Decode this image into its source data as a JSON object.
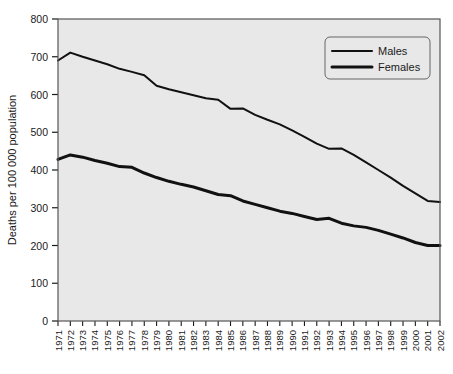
{
  "chart_data": {
    "type": "line",
    "title": "",
    "xlabel": "",
    "ylabel": "Deaths per 100 000 population",
    "ylim": [
      0,
      800
    ],
    "ytick_step": 100,
    "yticks": [
      "0",
      "100",
      "200",
      "300",
      "400",
      "500",
      "600",
      "700",
      "800"
    ],
    "grid": false,
    "legend_position": "top-right",
    "categories": [
      "1971",
      "1972",
      "1973",
      "1974",
      "1975",
      "1976",
      "1977",
      "1978",
      "1979",
      "1980",
      "1981",
      "1982",
      "1983",
      "1984",
      "1985",
      "1986",
      "1987",
      "1988",
      "1989",
      "1990",
      "1991",
      "1992",
      "1993",
      "1994",
      "1995",
      "1996",
      "1997",
      "1998",
      "1999",
      "2000",
      "2001",
      "2002"
    ],
    "series": [
      {
        "name": "Males",
        "color": "#111111",
        "line_width": 2.0,
        "values": [
          690,
          711,
          700,
          690,
          680,
          668,
          660,
          651,
          623,
          614,
          606,
          598,
          590,
          586,
          562,
          563,
          546,
          533,
          521,
          505,
          488,
          470,
          456,
          457,
          440,
          420,
          400,
          380,
          358,
          338,
          318,
          315
        ]
      },
      {
        "name": "Females",
        "color": "#111111",
        "line_width": 3.0,
        "values": [
          428,
          440,
          434,
          425,
          418,
          409,
          407,
          392,
          380,
          370,
          362,
          355,
          345,
          335,
          332,
          318,
          309,
          300,
          291,
          285,
          277,
          269,
          272,
          259,
          252,
          248,
          240,
          230,
          220,
          208,
          200,
          200
        ]
      }
    ]
  },
  "legend": {
    "items": [
      {
        "label": "Males"
      },
      {
        "label": "Females"
      }
    ]
  },
  "colors": {
    "plot_background": "#e8e8e8",
    "plot_border": "#555555",
    "line": "#111111",
    "text": "#1a1a1a",
    "page_background": "#ffffff"
  }
}
